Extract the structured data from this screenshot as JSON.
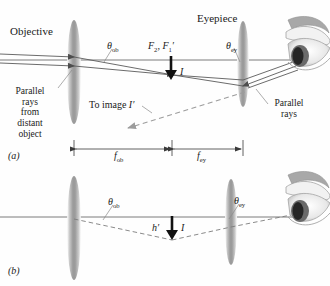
{
  "figure": {
    "panels": [
      "(a)",
      "(b)"
    ],
    "colors": {
      "background": "#fefefe",
      "ray": "#5a5a5a",
      "axis": "#6e6e6e",
      "lens": "#9a9a9a",
      "dashed": "#9c9c9c",
      "text": "#1a1a1a",
      "arrow_fill": "#111111",
      "eye_iris": "#3a3a3a"
    }
  },
  "panel_a": {
    "label": "(a)",
    "objective_label": "Objective",
    "eyepiece_label": "Eyepiece",
    "parallel_rays_from_distant_object": [
      "Parallel",
      "rays",
      "from",
      "distant",
      "object"
    ],
    "parallel_rays_right": [
      "Parallel",
      "rays"
    ],
    "theta_ob": "θ",
    "theta_ob_sub": "ob",
    "theta_ey": "θ",
    "theta_ey_sub": "ey",
    "focal_point_label_f2": "F",
    "focal_point_sub_2": "2",
    "focal_point_label_f1": ", F",
    "focal_point_sub_1": "1",
    "focal_point_prime": "′",
    "image_label": "I",
    "to_image_label": "To image ",
    "to_image_symbol": "I′",
    "f_ob": "f",
    "f_ob_sub": "ob",
    "f_ey": "f",
    "f_ey_sub": "ey"
  },
  "panel_b": {
    "label": "(b)",
    "theta_ob": "θ",
    "theta_ob_sub": "ob",
    "theta_ey": "θ",
    "theta_ey_sub": "ey",
    "h_prime": "h′",
    "image_label": "I"
  }
}
